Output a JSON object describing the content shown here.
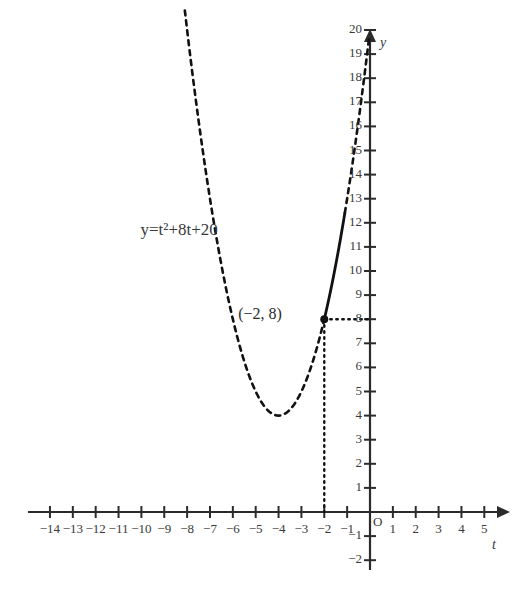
{
  "figure": {
    "equation_label": "y=t²+8t+20",
    "point_label": "(−2, 8)",
    "origin_label": "O",
    "x_axis_name": "t",
    "y_axis_name": "y",
    "curve_color": "#111111",
    "axis_color": "#2b2b2b",
    "label_color": "#3a3a3a"
  },
  "chart_data": {
    "type": "line",
    "title": "",
    "xlabel": "t",
    "ylabel": "y",
    "xlim": [
      -15,
      5.6
    ],
    "ylim": [
      -2.6,
      20.8
    ],
    "grid": false,
    "legend": "none",
    "function": "y = t^2 + 8t + 20",
    "vertex": [
      -4,
      4
    ],
    "annotations": [
      {
        "text": "y=t²+8t+20",
        "x": -9.6,
        "y": 11.6
      },
      {
        "text": "(−2, 8)",
        "x": -4.1,
        "y": 8.2
      }
    ],
    "marked_points": [
      {
        "x": -2,
        "y": 8,
        "style": "filled-dot"
      }
    ],
    "dotted_projections": [
      {
        "from": [
          -2,
          8
        ],
        "to": [
          0,
          8
        ]
      },
      {
        "from": [
          -2,
          8
        ],
        "to": [
          -2,
          0
        ]
      }
    ],
    "solid_segment": {
      "t_from": -2,
      "t_to": -1.1,
      "y_from": 8,
      "y_to": 17
    },
    "dashed_segments": [
      {
        "t_from": -8.1,
        "t_to": -2
      },
      {
        "t_from": -1.1,
        "t_to": -0.05
      }
    ],
    "x_ticks": [
      -14,
      -13,
      -12,
      -11,
      -10,
      -9,
      -8,
      -7,
      -6,
      -5,
      -4,
      -3,
      -2,
      -1,
      1,
      2,
      3,
      4,
      5
    ],
    "x_tick_labels": [
      "−14",
      "−13",
      "−12",
      "−11",
      "−10",
      "−9",
      "−8",
      "−7",
      "−6",
      "−5",
      "−4",
      "−3",
      "−2",
      "−1",
      "1",
      "2",
      "3",
      "4",
      "5"
    ],
    "y_ticks": [
      -2,
      -1,
      1,
      2,
      3,
      4,
      5,
      6,
      7,
      8,
      9,
      10,
      11,
      12,
      13,
      14,
      15,
      16,
      17,
      18,
      19,
      20
    ],
    "y_tick_labels": [
      "−2",
      "−1",
      "1",
      "2",
      "3",
      "4",
      "5",
      "6",
      "7",
      "8",
      "9",
      "10",
      "11",
      "12",
      "13",
      "14",
      "15",
      "16",
      "17",
      "18",
      "19",
      "20"
    ],
    "series": [
      {
        "name": "y = t^2 + 8t + 20",
        "x": [
          -8.1,
          -7.5,
          -7,
          -6.5,
          -6,
          -5.5,
          -5,
          -4.5,
          -4,
          -3.5,
          -3,
          -2.5,
          -2,
          -1.5,
          -1,
          -0.5,
          -0.05
        ],
        "values": [
          21.61,
          18.25,
          13,
          10.25,
          8,
          6.25,
          5,
          4.25,
          4,
          4.25,
          5,
          6.25,
          8,
          10.25,
          13,
          16.25,
          19.6
        ]
      }
    ]
  }
}
